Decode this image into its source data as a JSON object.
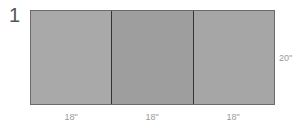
{
  "figure": {
    "number": "1",
    "panels": [
      {
        "width_label": "18\"",
        "color": "#a9a9a9"
      },
      {
        "width_label": "18\"",
        "color": "#9e9e9e"
      },
      {
        "width_label": "18\"",
        "color": "#a6a6a6"
      }
    ],
    "height_label": "20\""
  }
}
